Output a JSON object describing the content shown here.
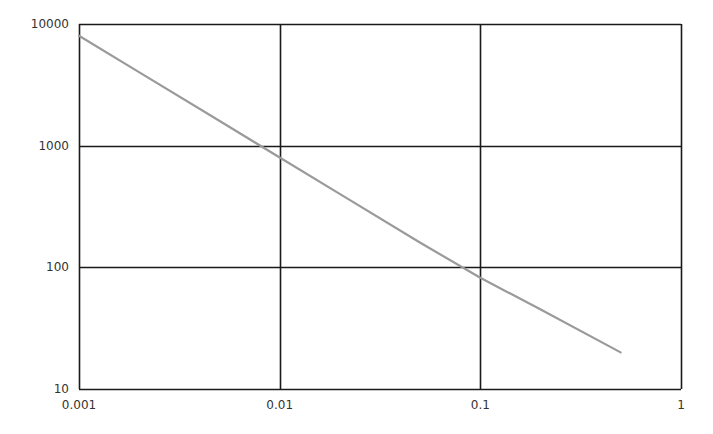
{
  "chart_data": {
    "type": "line",
    "title": "",
    "xlabel": "",
    "ylabel": "",
    "x_scale": "log",
    "y_scale": "log",
    "xlim": [
      0.001,
      1
    ],
    "ylim": [
      10,
      10000
    ],
    "grid": true,
    "legend": null,
    "x_ticks": [
      "0.001",
      "0.01",
      "0.1",
      "1"
    ],
    "y_ticks": [
      "10",
      "100",
      "1000",
      "10000"
    ],
    "series": [
      {
        "name": "series-1",
        "color": "#9a9a9a",
        "x": [
          0.001,
          0.002,
          0.005,
          0.01,
          0.02,
          0.05,
          0.1,
          0.2,
          0.5
        ],
        "y": [
          8000,
          4000,
          1600,
          800,
          400,
          160,
          82,
          45,
          20
        ]
      }
    ]
  },
  "style": {
    "grid_color": "#1a1a1a",
    "line_color": "#9a9a9a",
    "text_color": "#333333"
  }
}
